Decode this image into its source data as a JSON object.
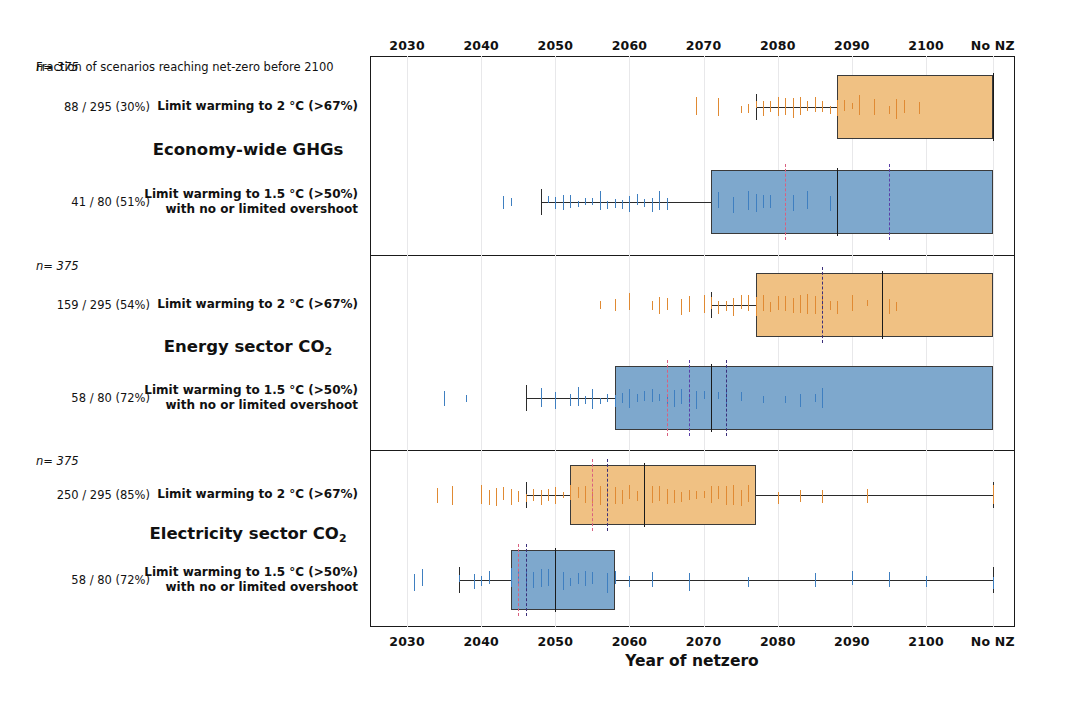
{
  "chart_data": {
    "type": "boxplot",
    "title": "",
    "xlabel": "Year of netzero",
    "ylabel": "",
    "xlim": [
      2025,
      2112
    ],
    "xticks": [
      {
        "label": "2030",
        "value": 2030
      },
      {
        "label": "2040",
        "value": 2040
      },
      {
        "label": "2050",
        "value": 2050
      },
      {
        "label": "2060",
        "value": 2060
      },
      {
        "label": "2070",
        "value": 2070
      },
      {
        "label": "2080",
        "value": 2080
      },
      {
        "label": "2090",
        "value": 2090
      },
      {
        "label": "2100",
        "value": 2100
      },
      {
        "label": "No NZ",
        "value": 2109
      }
    ],
    "axis_top": true,
    "axis_bottom": true,
    "grid": true,
    "legend": "none",
    "colors": {
      "orange_fill": "#f0c183",
      "blue_fill": "#7ea8cd",
      "orange_point": "#e08a33",
      "blue_point": "#3f7fc0",
      "box_edge": "#3a3a3a",
      "median": "#1a1a1a",
      "ref_pink": "#d9607f",
      "ref_purple": "#5b3fa8"
    },
    "header_note": "Fraction of scenarios reaching net-zero before 2100",
    "panels": [
      {
        "title": "Economy-wide GHGs",
        "title_sub": "",
        "n_label": "n= 375",
        "groups": [
          {
            "label_line1": "Limit warming to 2 °C (>67%)",
            "label_line2": "",
            "count": "88 / 295 (30%)",
            "color": "orange",
            "whisker_low": 2077,
            "q1": 2088,
            "median": 2109,
            "q3": 2109,
            "whisker_high": 2109,
            "refs": [],
            "points": [
              2069,
              2072,
              2075,
              2076,
              2077,
              2078,
              2078,
              2079,
              2080,
              2080,
              2081,
              2081,
              2082,
              2082,
              2083,
              2083,
              2084,
              2084,
              2085,
              2085,
              2086,
              2086,
              2087,
              2088,
              2089,
              2090,
              2091,
              2093,
              2095,
              2096,
              2097,
              2099
            ]
          },
          {
            "label_line1": "Limit warming to 1.5 °C (>50%)",
            "label_line2": "with no or limited overshoot",
            "count": "41 / 80 (51%)",
            "color": "blue",
            "whisker_low": 2048,
            "q1": 2071,
            "median": 2088,
            "q3": 2109,
            "whisker_high": 2109,
            "refs": [
              {
                "value": 2081,
                "style": "pink"
              },
              {
                "value": 2095,
                "style": "purple"
              }
            ],
            "points": [
              2043,
              2044,
              2049,
              2050,
              2051,
              2052,
              2053,
              2054,
              2055,
              2056,
              2057,
              2058,
              2059,
              2060,
              2061,
              2062,
              2063,
              2064,
              2065,
              2072,
              2074,
              2076,
              2077,
              2077,
              2078,
              2079,
              2082,
              2084,
              2087,
              2088
            ]
          }
        ]
      },
      {
        "title": "Energy sector CO",
        "title_sub": "2",
        "n_label": "n= 375",
        "groups": [
          {
            "label_line1": "Limit warming to 2 °C (>67%)",
            "label_line2": "",
            "count": "159 / 295 (54%)",
            "color": "orange",
            "whisker_low": 2071,
            "q1": 2077,
            "median": 2094,
            "q3": 2109,
            "whisker_high": 2109,
            "refs": [
              {
                "value": 2086,
                "style": "dashdot"
              }
            ],
            "points": [
              2056,
              2058,
              2060,
              2063,
              2064,
              2065,
              2067,
              2068,
              2070,
              2071,
              2072,
              2073,
              2074,
              2074,
              2075,
              2075,
              2076,
              2076,
              2077,
              2078,
              2079,
              2080,
              2081,
              2082,
              2083,
              2084,
              2085,
              2086,
              2087,
              2088,
              2090,
              2092,
              2095,
              2096
            ]
          },
          {
            "label_line1": "Limit warming to 1.5 °C (>50%)",
            "label_line2": "with no or limited overshoot",
            "count": "58 / 80 (72%)",
            "color": "blue",
            "whisker_low": 2046,
            "q1": 2058,
            "median": 2071,
            "q3": 2109,
            "whisker_high": 2109,
            "refs": [
              {
                "value": 2065,
                "style": "pink"
              },
              {
                "value": 2068,
                "style": "purple"
              },
              {
                "value": 2073,
                "style": "dashdot"
              }
            ],
            "points": [
              2035,
              2038,
              2048,
              2050,
              2052,
              2053,
              2054,
              2055,
              2056,
              2057,
              2058,
              2059,
              2060,
              2061,
              2062,
              2063,
              2064,
              2065,
              2066,
              2067,
              2068,
              2069,
              2070,
              2071,
              2072,
              2073,
              2075,
              2078,
              2081,
              2083,
              2085,
              2086
            ]
          }
        ]
      },
      {
        "title": "Electricity sector CO",
        "title_sub": "2",
        "n_label": "n= 375",
        "groups": [
          {
            "label_line1": "Limit warming to 2 °C (>67%)",
            "label_line2": "",
            "count": "250 / 295 (85%)",
            "color": "orange",
            "whisker_low": 2046,
            "q1": 2052,
            "median": 2062,
            "q3": 2077,
            "whisker_high": 2109,
            "refs": [
              {
                "value": 2055,
                "style": "pink"
              },
              {
                "value": 2057,
                "style": "dashdot"
              }
            ],
            "points": [
              2034,
              2036,
              2040,
              2041,
              2042,
              2043,
              2044,
              2045,
              2046,
              2047,
              2048,
              2049,
              2050,
              2051,
              2052,
              2053,
              2054,
              2055,
              2056,
              2057,
              2058,
              2059,
              2060,
              2061,
              2062,
              2063,
              2064,
              2065,
              2066,
              2067,
              2068,
              2069,
              2070,
              2071,
              2072,
              2073,
              2074,
              2075,
              2076,
              2080,
              2083,
              2086,
              2092,
              2109
            ]
          },
          {
            "label_line1": "Limit warming to 1.5 °C (>50%)",
            "label_line2": "with no or limited overshoot",
            "count": "58 / 80 (72%)",
            "color": "blue",
            "whisker_low": 2037,
            "q1": 2044,
            "median": 2050,
            "q3": 2058,
            "whisker_high": 2109,
            "refs": [
              {
                "value": 2045,
                "style": "pink"
              },
              {
                "value": 2046,
                "style": "dashdot"
              }
            ],
            "points": [
              2031,
              2032,
              2037,
              2039,
              2040,
              2041,
              2044,
              2045,
              2046,
              2047,
              2048,
              2049,
              2050,
              2051,
              2052,
              2053,
              2054,
              2055,
              2057,
              2058,
              2060,
              2063,
              2068,
              2076,
              2085,
              2090,
              2095,
              2100,
              2109
            ]
          }
        ]
      }
    ]
  }
}
